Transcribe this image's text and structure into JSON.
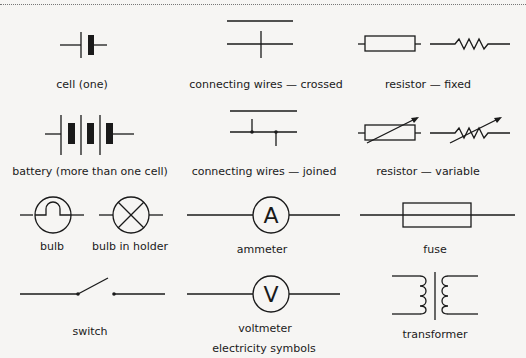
{
  "figure": {
    "caption": "electricity symbols",
    "symbols": [
      {
        "id": "cell",
        "label": "cell (one)"
      },
      {
        "id": "wires-crossed",
        "label": "connecting wires — crossed"
      },
      {
        "id": "resistor-fixed",
        "label": "resistor — fixed"
      },
      {
        "id": "battery",
        "label": "battery (more than one cell)"
      },
      {
        "id": "wires-joined",
        "label": "connecting wires — joined"
      },
      {
        "id": "resistor-variable",
        "label": "resistor — variable"
      },
      {
        "id": "bulb",
        "label": "bulb"
      },
      {
        "id": "bulb-in-holder",
        "label": "bulb in holder"
      },
      {
        "id": "ammeter",
        "label": "ammeter",
        "glyph": "A"
      },
      {
        "id": "fuse",
        "label": "fuse"
      },
      {
        "id": "switch",
        "label": "switch"
      },
      {
        "id": "voltmeter",
        "label": "voltmeter",
        "glyph": "V"
      },
      {
        "id": "transformer",
        "label": "transformer"
      }
    ]
  },
  "colors": {
    "ink": "#1a1a1a",
    "paper": "#f6f5f3",
    "showthrough": "#c9c7c4"
  }
}
